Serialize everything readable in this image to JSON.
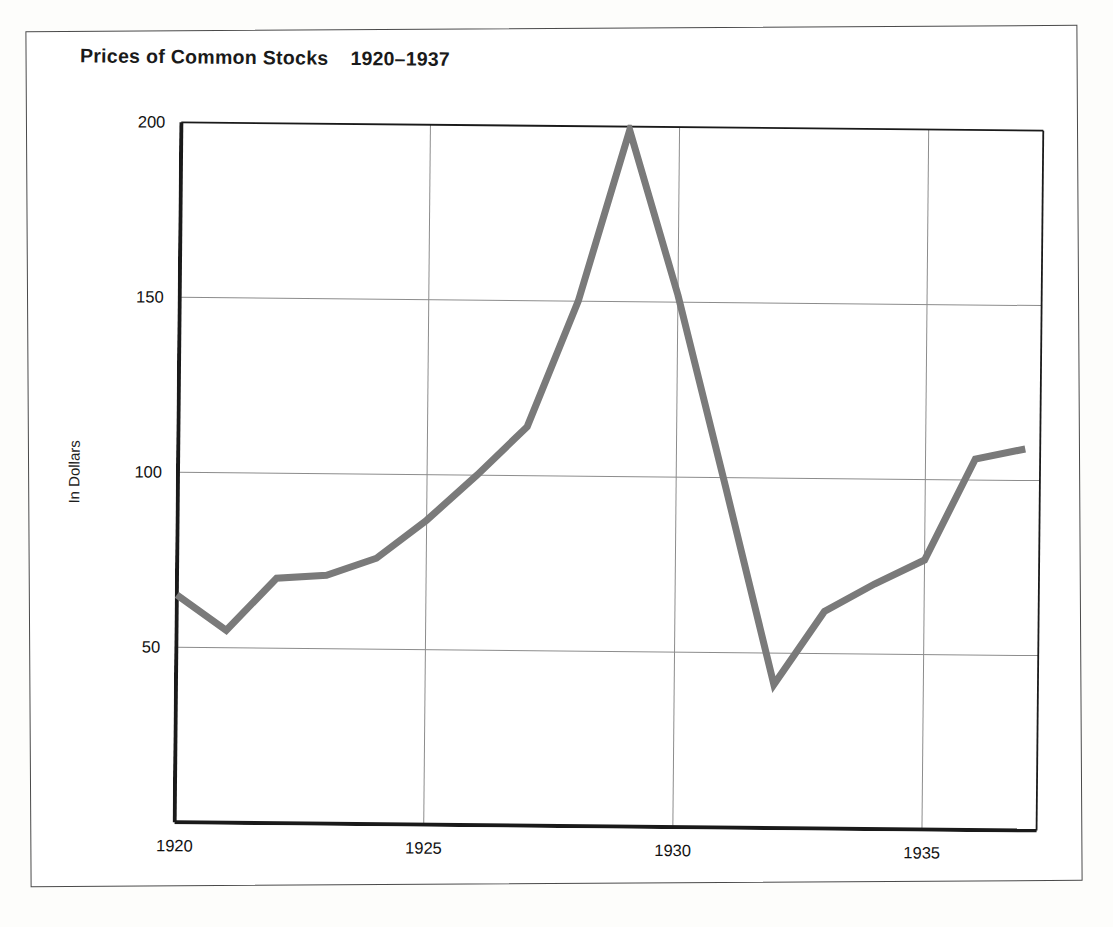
{
  "figure": {
    "title_main": "Prices of Common Stocks",
    "title_years": "1920–1937",
    "frame_color": "#1a1a1a",
    "grid_color": "#8c8c8c",
    "line_color": "#7a7a7a",
    "background": "#ffffff"
  },
  "axes": {
    "ylabel": "In Dollars",
    "xlabel": "",
    "y_ticks": [
      "200",
      "150",
      "100",
      "50"
    ],
    "x_ticks": [
      "1920",
      "1925",
      "1930",
      "1935"
    ]
  },
  "chart_data": {
    "type": "line",
    "xlabel": "",
    "ylabel": "In Dollars",
    "xlim": [
      1920,
      1937.3
    ],
    "ylim": [
      0,
      200
    ],
    "yticks": [
      50,
      100,
      150,
      200
    ],
    "xticks": [
      1920,
      1925,
      1930,
      1935
    ],
    "grid": "both",
    "legend": "none",
    "x": [
      1920,
      1921,
      1922,
      1923,
      1924,
      1925,
      1926,
      1927,
      1928,
      1929,
      1930,
      1931,
      1932,
      1933,
      1934,
      1935,
      1936,
      1937
    ],
    "series": [
      {
        "name": "Prices of Common Stocks",
        "values": [
          65,
          55,
          70,
          71,
          76,
          87,
          100,
          114,
          150,
          199,
          152,
          97,
          41,
          62,
          70,
          77,
          106,
          109
        ]
      }
    ],
    "annotations": []
  }
}
